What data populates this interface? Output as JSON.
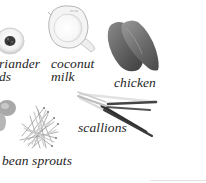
{
  "page": {
    "background": "#ffffff",
    "width": 206,
    "height": 183
  },
  "ingredients": [
    {
      "id": "coriander-seeds",
      "label_lines": [
        "riander",
        "ds"
      ],
      "full_name": "coriander seeds",
      "icon": "seed-dish-icon",
      "partially_cropped": true
    },
    {
      "id": "coconut-milk",
      "label_lines": [
        "coconut",
        "milk"
      ],
      "icon": "measuring-jug-icon"
    },
    {
      "id": "chicken",
      "label_lines": [
        "chicken"
      ],
      "icon": "chicken-breast-icon"
    },
    {
      "id": "shallots",
      "label_lines": [],
      "icon": "shallot-icon",
      "partially_cropped": true
    },
    {
      "id": "bean-sprouts",
      "label_lines": [
        "bean sprouts"
      ],
      "icon": "bean-sprouts-icon"
    },
    {
      "id": "scallions",
      "label_lines": [
        "scallions"
      ],
      "icon": "scallions-icon"
    }
  ],
  "colors": {
    "label_text": "#1e1e1e",
    "chicken_dark": "#4a4a4a",
    "chicken_mid": "#7a7a7a",
    "jug_outline": "#b8b8b8",
    "seed_dark": "#2e2e2e"
  }
}
